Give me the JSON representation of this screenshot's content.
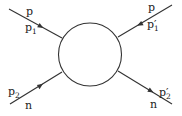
{
  "diagram": {
    "type": "scattering-vertex",
    "colors": {
      "stroke": "#333333",
      "background": "#ffffff",
      "text": "#222222"
    },
    "blob": {
      "cx": 90,
      "cy": 54.5,
      "r": 31.5
    },
    "legs": [
      {
        "id": "top-left",
        "x1": 9,
        "y1": 9,
        "x2": 62,
        "y2": 38,
        "arrow": "toward-blob",
        "labels": [
          {
            "base": "p",
            "sub": "",
            "prime": false
          },
          {
            "base": "p",
            "sub": "1",
            "prime": false
          }
        ]
      },
      {
        "id": "top-right",
        "x1": 172,
        "y1": 5,
        "x2": 118,
        "y2": 37,
        "arrow": "away-from-blob",
        "labels": [
          {
            "base": "p",
            "sub": "",
            "prime": false
          },
          {
            "base": "p",
            "sub": "1",
            "prime": true
          }
        ]
      },
      {
        "id": "bottom-left",
        "x1": 10,
        "y1": 104,
        "x2": 62,
        "y2": 72,
        "arrow": "toward-blob",
        "labels": [
          {
            "base": "p",
            "sub": "2",
            "prime": false
          },
          {
            "base": "n",
            "sub": "",
            "prime": false
          }
        ]
      },
      {
        "id": "bottom-right",
        "x1": 172,
        "y1": 104,
        "x2": 118,
        "y2": 71,
        "arrow": "away-from-blob",
        "labels": [
          {
            "base": "p",
            "sub": "2",
            "prime": true
          },
          {
            "base": "n",
            "sub": "",
            "prime": false
          }
        ]
      }
    ],
    "text": {
      "tl_particle": "p",
      "tl_momentum_base": "p",
      "tl_momentum_sub": "1",
      "tr_particle": "p",
      "tr_momentum_base": "p′",
      "tr_momentum_sub": "1",
      "bl_momentum_base": "p",
      "bl_momentum_sub": "2",
      "bl_particle": "n",
      "br_momentum_base": "p′",
      "br_momentum_sub": "2",
      "br_particle": "n"
    }
  }
}
